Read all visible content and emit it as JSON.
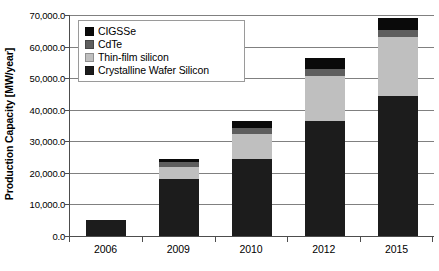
{
  "chart_data": {
    "type": "bar",
    "subtype": "stacked-bar",
    "title": "",
    "xlabel": "",
    "ylabel": "Production Capacity [MW/year]",
    "categories": [
      "2006",
      "2009",
      "2010",
      "2012",
      "2015"
    ],
    "ylim": [
      0,
      70000
    ],
    "ytick_step": 10000,
    "ytick_labels": [
      "0.0",
      "10,000.0",
      "20,000.0",
      "30,000.0",
      "40,000.0",
      "50,000.0",
      "60,000.0",
      "70,000.0"
    ],
    "ytick_values": [
      0,
      10000,
      20000,
      30000,
      40000,
      50000,
      60000,
      70000
    ],
    "grid": true,
    "grid_axis": "y",
    "legend_position": "upper-left-inside",
    "stack_order_bottom_to_top": [
      "Crystalline Wafer Silicon",
      "Thin-film silicon",
      "CdTe",
      "CIGSSe"
    ],
    "series": [
      {
        "name": "CIGSSe",
        "color": "#0a0a0a",
        "values": [
          0,
          1000,
          2200,
          3700,
          3700
        ]
      },
      {
        "name": "CdTe",
        "color": "#5e5e5e",
        "values": [
          0,
          1500,
          2000,
          2000,
          2300
        ]
      },
      {
        "name": "Thin-film silicon",
        "color": "#bfbfbf",
        "values": [
          0,
          4000,
          7800,
          14300,
          18500
        ]
      },
      {
        "name": "Crystalline Wafer Silicon",
        "color": "#1c1c1c",
        "values": [
          5000,
          18000,
          24500,
          36500,
          44500
        ]
      }
    ],
    "totals": [
      5000,
      24500,
      36500,
      56500,
      69000
    ]
  },
  "legend": {
    "items": [
      {
        "label": "CIGSSe",
        "color": "#0a0a0a"
      },
      {
        "label": "CdTe",
        "color": "#5e5e5e"
      },
      {
        "label": "Thin-film silicon",
        "color": "#bfbfbf"
      },
      {
        "label": "Crystalline Wafer Silicon",
        "color": "#1c1c1c"
      }
    ]
  },
  "axes": {
    "y_title": "Production Capacity [MW/year]",
    "axis_color": "#4d4d4d",
    "grid_color": "#808080"
  }
}
